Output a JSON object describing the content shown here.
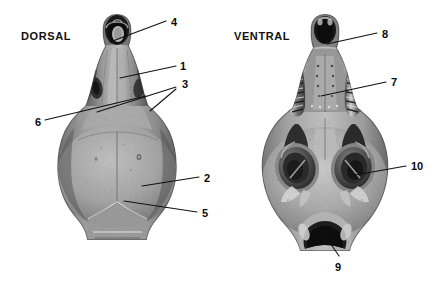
{
  "figure": {
    "background_color": "#ffffff",
    "width": 441,
    "height": 286,
    "line_color": "#111111",
    "text_color": "#0a0a0a"
  },
  "views": [
    {
      "id": "dorsal",
      "title": "DORSAL",
      "title_x": 21,
      "title_y": 30,
      "specimen_name": "rodent-skull-dorsal-photograph",
      "specimen_center_x": 117,
      "specimen_top_y": 14,
      "specimen_bottom_y": 245
    },
    {
      "id": "ventral",
      "title": "VENTRAL",
      "title_x": 234,
      "title_y": 30,
      "specimen_name": "rodent-skull-ventral-photograph",
      "specimen_center_x": 325,
      "specimen_top_y": 14,
      "specimen_bottom_y": 252
    }
  ],
  "callouts": [
    {
      "id": "callout-4",
      "label": "4",
      "view": "dorsal",
      "label_x": 171,
      "label_y": 16,
      "leader": [
        [
          110,
          42
        ],
        [
          166,
          21
        ]
      ]
    },
    {
      "id": "callout-1",
      "label": "1",
      "view": "dorsal",
      "label_x": 180,
      "label_y": 60,
      "leader": [
        [
          120,
          78
        ],
        [
          176,
          66
        ]
      ]
    },
    {
      "id": "callout-3",
      "label": "3",
      "view": "dorsal",
      "label_x": 182,
      "label_y": 78,
      "leader_multi": [
        [
          [
            97,
            112
          ],
          [
            176,
            87
          ]
        ],
        [
          [
            150,
            111
          ],
          [
            176,
            89
          ]
        ]
      ]
    },
    {
      "id": "callout-6",
      "label": "6",
      "view": "dorsal",
      "label_x": 35,
      "label_y": 116,
      "leader": [
        [
          146,
          96
        ],
        [
          45,
          120
        ]
      ]
    },
    {
      "id": "callout-2",
      "label": "2",
      "view": "dorsal",
      "label_x": 204,
      "label_y": 172,
      "leader": [
        [
          142,
          186
        ],
        [
          199,
          177
        ]
      ]
    },
    {
      "id": "callout-5",
      "label": "5",
      "view": "dorsal",
      "label_x": 202,
      "label_y": 207,
      "leader": [
        [
          124,
          201
        ],
        [
          197,
          212
        ]
      ]
    },
    {
      "id": "callout-8",
      "label": "8",
      "view": "ventral",
      "label_x": 382,
      "label_y": 28,
      "leader": [
        [
          327,
          44
        ],
        [
          377,
          33
        ]
      ]
    },
    {
      "id": "callout-7",
      "label": "7",
      "view": "ventral",
      "label_x": 391,
      "label_y": 76,
      "leader": [
        [
          321,
          96
        ],
        [
          386,
          82
        ]
      ]
    },
    {
      "id": "callout-10",
      "label": "10",
      "view": "ventral",
      "label_x": 411,
      "label_y": 160,
      "leader": [
        [
          355,
          175
        ],
        [
          406,
          166
        ]
      ]
    },
    {
      "id": "callout-9",
      "label": "9",
      "view": "ventral",
      "label_x": 335,
      "label_y": 261,
      "leader": [
        [
          320,
          228
        ],
        [
          339,
          256
        ]
      ]
    }
  ]
}
